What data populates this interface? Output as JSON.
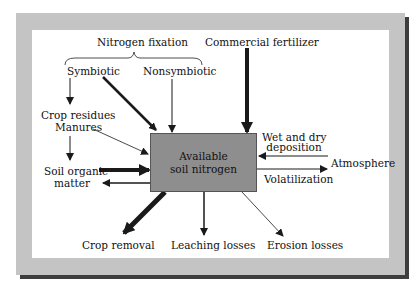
{
  "diagram": {
    "central_node": {
      "line1": "Available",
      "line2": "soil nitrogen",
      "color": "#8e8e8e"
    },
    "group_label": "Nitrogen fixation",
    "inputs": {
      "symbiotic": "Symbiotic",
      "nonsymbiotic": "Nonsymbiotic",
      "commercial_fertilizer": "Commercial fertilizer",
      "crop_residues": "Crop residues",
      "manures": "Manures",
      "soil_organic_line1": "Soil organic",
      "soil_organic_line2": "matter",
      "wet_dry_line1": "Wet and dry",
      "wet_dry_line2": "deposition",
      "atmosphere": "Atmosphere"
    },
    "outputs": {
      "volatilization": "Volatilization",
      "crop_removal": "Crop removal",
      "leaching": "Leaching losses",
      "erosion": "Erosion losses"
    },
    "colors": {
      "frame": "#c4c4c4",
      "shadow": "#3d3d3d",
      "arrow": "#1a1a1a"
    }
  }
}
